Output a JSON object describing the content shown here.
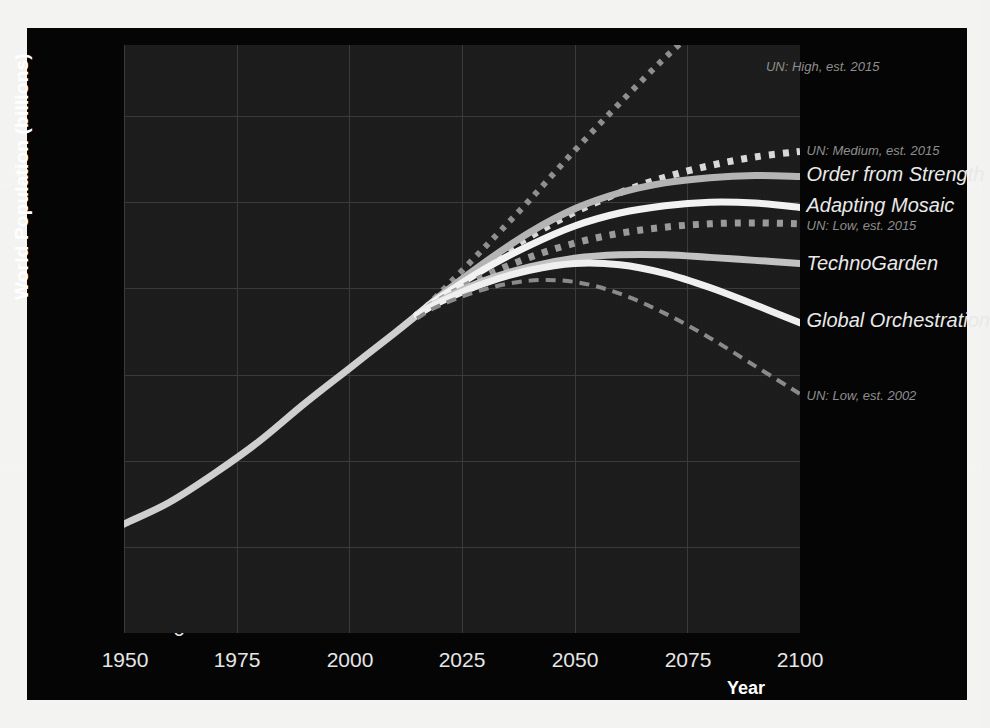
{
  "chart_data": {
    "type": "line",
    "title": "",
    "xlabel": "Year",
    "ylabel": "World Population  (billions)",
    "xlim": [
      1950,
      2100
    ],
    "ylim": [
      0,
      13.2
    ],
    "xticks": [
      "1950",
      "1975",
      "2000",
      "2025",
      "2050",
      "2075",
      "2100"
    ],
    "yticks": [
      "0",
      "2",
      "4",
      "6",
      "8",
      "10",
      "12"
    ],
    "grid": true,
    "legend_position": "right-inline-labels",
    "background_color": "#1c1c1c",
    "figure_color": "#050505",
    "x": [
      1950,
      1960,
      1970,
      1980,
      1990,
      2000,
      2010,
      2015,
      2020,
      2030,
      2040,
      2050,
      2060,
      2070,
      2080,
      2090,
      2100
    ],
    "series": [
      {
        "name": "Historical",
        "label": "",
        "style": "solid",
        "color": "#cfcfcf",
        "width": 7,
        "x": [
          1950,
          1960,
          1970,
          1980,
          1990,
          2000,
          2010,
          2015
        ],
        "values": [
          2.53,
          3.03,
          3.7,
          4.45,
          5.32,
          6.14,
          6.96,
          7.38
        ]
      },
      {
        "name": "UN: High, est. 2015",
        "label": "UN: High, est. 2015",
        "style": "dotted",
        "color": "#8f8f8f",
        "width": 6,
        "x": [
          2015,
          2020,
          2030,
          2040,
          2050,
          2060,
          2070,
          2080,
          2090,
          2100
        ],
        "values": [
          7.38,
          7.88,
          8.95,
          10.05,
          11.2,
          12.3,
          13.35,
          14.3,
          15.2,
          16.0
        ],
        "label_xy": [
          2092,
          13.15
        ]
      },
      {
        "name": "UN: Medium, est. 2015",
        "label": "UN: Medium, est. 2015",
        "style": "dotted",
        "color": "#d8d8d8",
        "width": 7,
        "x": [
          2015,
          2020,
          2030,
          2040,
          2050,
          2060,
          2070,
          2080,
          2090,
          2100
        ],
        "values": [
          7.38,
          7.8,
          8.55,
          9.2,
          9.77,
          10.22,
          10.58,
          10.85,
          11.05,
          11.18
        ],
        "label_xy": [
          2101,
          11.2
        ]
      },
      {
        "name": "Order from Strength",
        "label": "Order from Strength",
        "style": "solid",
        "color": "#b4b4b4",
        "width": 7,
        "x": [
          2015,
          2020,
          2030,
          2040,
          2050,
          2060,
          2070,
          2080,
          2090,
          2100
        ],
        "values": [
          7.38,
          7.82,
          8.6,
          9.3,
          9.85,
          10.22,
          10.45,
          10.57,
          10.62,
          10.6
        ],
        "label_xy": [
          2101,
          10.6
        ]
      },
      {
        "name": "Adapting Mosaic",
        "label": "Adapting Mosaic",
        "style": "solid",
        "color": "#f2f2f2",
        "width": 7,
        "x": [
          2015,
          2020,
          2030,
          2040,
          2050,
          2060,
          2070,
          2080,
          2090,
          2100
        ],
        "values": [
          7.38,
          7.78,
          8.45,
          9.0,
          9.45,
          9.75,
          9.92,
          10.0,
          9.98,
          9.88
        ],
        "label_xy": [
          2101,
          9.9
        ]
      },
      {
        "name": "UN: Low, est. 2015",
        "label": "UN: Low, est. 2015",
        "style": "dotted",
        "color": "#9a9a9a",
        "width": 7,
        "x": [
          2015,
          2020,
          2030,
          2040,
          2050,
          2060,
          2070,
          2080,
          2090,
          2100
        ],
        "values": [
          7.38,
          7.72,
          8.28,
          8.72,
          9.05,
          9.28,
          9.42,
          9.5,
          9.52,
          9.5
        ],
        "label_xy": [
          2101,
          9.45
        ]
      },
      {
        "name": "TechnoGarden",
        "label": "TechnoGarden",
        "style": "solid",
        "color": "#c2c2c2",
        "width": 7,
        "x": [
          2015,
          2020,
          2030,
          2040,
          2050,
          2060,
          2070,
          2080,
          2090,
          2100
        ],
        "values": [
          7.38,
          7.7,
          8.18,
          8.5,
          8.7,
          8.78,
          8.78,
          8.72,
          8.65,
          8.58
        ],
        "label_xy": [
          2101,
          8.55
        ]
      },
      {
        "name": "Global Orchestration",
        "label": "Global Orchestration",
        "style": "solid",
        "color": "#efefef",
        "width": 7,
        "x": [
          2015,
          2020,
          2030,
          2040,
          2050,
          2060,
          2070,
          2080,
          2090,
          2100
        ],
        "values": [
          7.38,
          7.68,
          8.12,
          8.42,
          8.58,
          8.55,
          8.35,
          8.02,
          7.62,
          7.2
        ],
        "label_xy": [
          2101,
          7.22
        ]
      },
      {
        "name": "UN: Low, est. 2002",
        "label": "UN: Low, est. 2002",
        "style": "dashed",
        "color": "#8a8a8a",
        "width": 4,
        "x": [
          2015,
          2020,
          2030,
          2040,
          2050,
          2060,
          2070,
          2080,
          2090,
          2100
        ],
        "values": [
          7.3,
          7.6,
          7.98,
          8.18,
          8.15,
          7.88,
          7.42,
          6.85,
          6.2,
          5.55
        ],
        "label_xy": [
          2101,
          5.5
        ]
      }
    ]
  },
  "axes": {
    "y_axis_title": "World Population  (billions)",
    "x_axis_title": "Year",
    "x_tick_labels": [
      "1950",
      "1975",
      "2000",
      "2025",
      "2050",
      "2075",
      "2100"
    ],
    "y_tick_labels": [
      "12",
      "10",
      "8",
      "6",
      "4",
      "2",
      "0"
    ]
  },
  "labels": {
    "un_high_2015": "UN: High, est. 2015",
    "un_medium_2015": "UN: Medium, est. 2015",
    "order_from_strength": "Order from Strength",
    "adapting_mosaic": "Adapting Mosaic",
    "un_low_2015": "UN: Low, est. 2015",
    "technogarden": "TechnoGarden",
    "global_orchestration": "Global Orchestration",
    "un_low_2002": "UN: Low, est. 2002"
  }
}
